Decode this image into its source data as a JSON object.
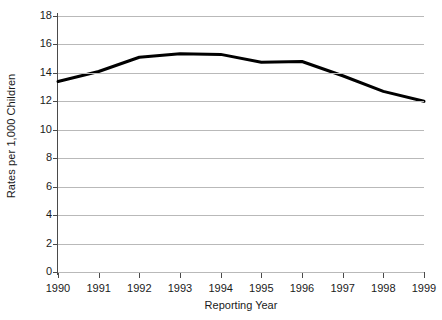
{
  "chart_data": {
    "type": "line",
    "title": "",
    "xlabel": "Reporting Year",
    "ylabel": "Rates per 1,000 Children",
    "categories": [
      "1990",
      "1991",
      "1992",
      "1993",
      "1994",
      "1995",
      "1996",
      "1997",
      "1998",
      "1999"
    ],
    "values": [
      13.4,
      14.1,
      15.1,
      15.35,
      15.3,
      14.75,
      14.8,
      13.8,
      12.7,
      12.0
    ],
    "series": [
      {
        "name": "Rates per 1,000 Children",
        "values": [
          13.4,
          14.1,
          15.1,
          15.35,
          15.3,
          14.75,
          14.8,
          13.8,
          12.7,
          12.0
        ],
        "color": "#000000"
      }
    ],
    "ylim": [
      0,
      18
    ],
    "y_ticks": [
      0,
      2,
      4,
      6,
      8,
      10,
      12,
      14,
      16,
      18
    ],
    "y_tick_labels": [
      "0",
      "2",
      "4",
      "6",
      "8",
      "10",
      "12",
      "14",
      "16",
      "18"
    ],
    "x_tick_labels": [
      "1990",
      "1991",
      "1992",
      "1993",
      "1994",
      "1995",
      "1996",
      "1997",
      "1998",
      "1999"
    ],
    "grid": true,
    "grid_axis": "y",
    "legend": false,
    "legend_position": "none",
    "line_width": 3,
    "marker": "none",
    "colors": {
      "line": "#000000",
      "grid": "#b9b9b9",
      "axis": "#4a4a4a",
      "text": "#1a1a1a",
      "background": "#ffffff"
    }
  }
}
